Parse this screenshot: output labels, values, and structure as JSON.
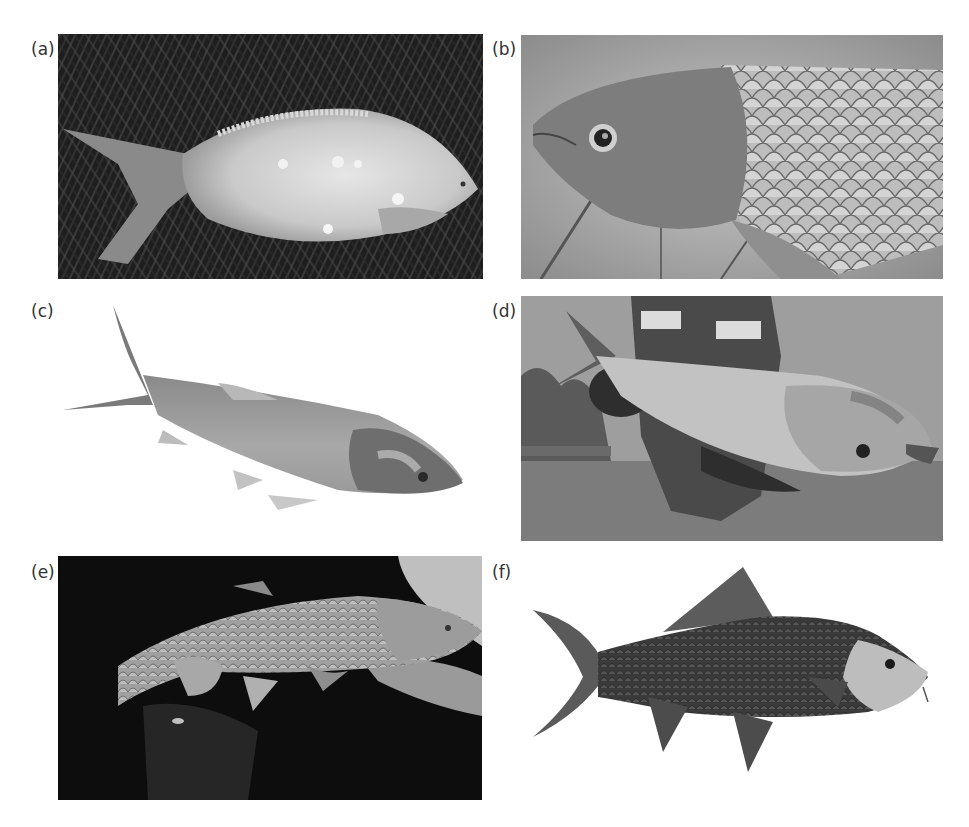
{
  "figure": {
    "panels": [
      {
        "id": "a",
        "label": "(a)",
        "description": "Pale carp-like fish lying on dark grass, with lesions along body",
        "background": "dark grass"
      },
      {
        "id": "b",
        "label": "(b)",
        "description": "Close-up of a grass carp head and scaled body",
        "background": "blurred foliage"
      },
      {
        "id": "c",
        "label": "(c)",
        "description": "Silver/bighead carp isolated on white background",
        "background": "white"
      },
      {
        "id": "d",
        "label": "(d)",
        "description": "Person in life vest holding a large bighead carp over water",
        "background": "water and sky"
      },
      {
        "id": "e",
        "label": "(e)",
        "description": "Scaled fish held in hands against dark background",
        "background": "black"
      },
      {
        "id": "f",
        "label": "(f)",
        "description": "Illustration of a dark-scaled barbel fish with pale head",
        "background": "white"
      }
    ],
    "colors": {
      "label_text": "#333333",
      "background": "#ffffff"
    }
  }
}
